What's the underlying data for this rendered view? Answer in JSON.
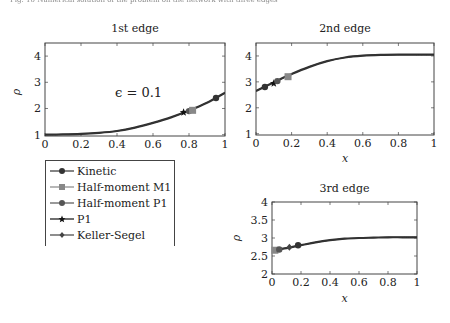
{
  "caption": "Fig. 10 Numerical solution of the problem on the network with three edges",
  "chart_data": [
    {
      "type": "line",
      "title": "1st edge",
      "xlabel": "",
      "ylabel": "ρ",
      "xlim": [
        0,
        1
      ],
      "ylim": [
        0.95,
        4.5
      ],
      "xticks": [
        "0",
        "0.2",
        "0.4",
        "0.6",
        "0.8",
        "1"
      ],
      "yticks": [
        "1",
        "2",
        "3",
        "4"
      ],
      "annotation": "ϵ = 0.1",
      "grid": false,
      "x": [
        0,
        0.1,
        0.2,
        0.3,
        0.4,
        0.5,
        0.6,
        0.7,
        0.8,
        0.9,
        1.0
      ],
      "series": [
        {
          "name": "Kinetic",
          "values": [
            1.0,
            1.01,
            1.03,
            1.07,
            1.14,
            1.27,
            1.45,
            1.66,
            1.92,
            2.22,
            2.6
          ]
        },
        {
          "name": "Half-moment M1",
          "values": [
            1.0,
            1.01,
            1.03,
            1.07,
            1.14,
            1.27,
            1.45,
            1.66,
            1.92,
            2.22,
            2.6
          ]
        },
        {
          "name": "Half-moment P1",
          "values": [
            1.0,
            1.01,
            1.03,
            1.07,
            1.14,
            1.27,
            1.45,
            1.66,
            1.92,
            2.22,
            2.6
          ]
        },
        {
          "name": "P1",
          "values": [
            1.0,
            1.01,
            1.03,
            1.07,
            1.14,
            1.27,
            1.45,
            1.66,
            1.92,
            2.22,
            2.6
          ]
        },
        {
          "name": "Keller-Segel",
          "values": [
            1.0,
            1.01,
            1.03,
            1.07,
            1.14,
            1.27,
            1.45,
            1.66,
            1.92,
            2.22,
            2.6
          ]
        }
      ],
      "markers": [
        {
          "series": "P1",
          "x": 0.77,
          "y": 1.86
        },
        {
          "series": "Half-moment P1",
          "x": 0.8,
          "y": 1.9
        },
        {
          "series": "Half-moment M1",
          "x": 0.82,
          "y": 1.93
        },
        {
          "series": "Kinetic",
          "x": 0.95,
          "y": 2.4
        }
      ]
    },
    {
      "type": "line",
      "title": "2nd edge",
      "xlabel": "x",
      "ylabel": "",
      "xlim": [
        0,
        1
      ],
      "ylim": [
        0.95,
        4.5
      ],
      "xticks": [
        "0",
        "0.2",
        "0.4",
        "0.6",
        "0.8",
        "1"
      ],
      "yticks": [
        "1",
        "2",
        "3",
        "4"
      ],
      "grid": false,
      "x": [
        0,
        0.1,
        0.2,
        0.3,
        0.4,
        0.5,
        0.6,
        0.7,
        0.8,
        0.9,
        1.0
      ],
      "series": [
        {
          "name": "Kinetic",
          "values": [
            2.65,
            2.98,
            3.3,
            3.58,
            3.8,
            3.94,
            4.01,
            4.04,
            4.05,
            4.05,
            4.05
          ]
        },
        {
          "name": "Half-moment M1",
          "values": [
            2.65,
            2.98,
            3.3,
            3.58,
            3.8,
            3.94,
            4.01,
            4.04,
            4.05,
            4.05,
            4.05
          ]
        },
        {
          "name": "Half-moment P1",
          "values": [
            2.65,
            2.98,
            3.3,
            3.58,
            3.8,
            3.94,
            4.01,
            4.04,
            4.05,
            4.05,
            4.05
          ]
        },
        {
          "name": "P1",
          "values": [
            2.65,
            2.98,
            3.3,
            3.58,
            3.8,
            3.94,
            4.01,
            4.04,
            4.05,
            4.05,
            4.05
          ]
        },
        {
          "name": "Keller-Segel",
          "values": [
            2.65,
            2.98,
            3.3,
            3.58,
            3.8,
            3.94,
            4.01,
            4.04,
            4.05,
            4.05,
            4.05
          ]
        }
      ],
      "markers": [
        {
          "series": "Kinetic",
          "x": 0.05,
          "y": 2.8
        },
        {
          "series": "P1",
          "x": 0.1,
          "y": 2.95
        },
        {
          "series": "Half-moment P1",
          "x": 0.12,
          "y": 3.03
        },
        {
          "series": "Half-moment M1",
          "x": 0.18,
          "y": 3.2
        }
      ]
    },
    {
      "type": "line",
      "title": "3rd edge",
      "xlabel": "x",
      "ylabel": "ρ",
      "xlim": [
        0,
        1
      ],
      "ylim": [
        2,
        4
      ],
      "xticks": [
        "0",
        "0.2",
        "0.4",
        "0.6",
        "0.8",
        "1"
      ],
      "yticks": [
        "2",
        "2.5",
        "3",
        "3.5",
        "4"
      ],
      "grid": false,
      "x": [
        0,
        0.1,
        0.2,
        0.3,
        0.4,
        0.5,
        0.6,
        0.7,
        0.8,
        0.9,
        1.0
      ],
      "series": [
        {
          "name": "Kinetic",
          "values": [
            2.66,
            2.72,
            2.8,
            2.88,
            2.94,
            2.98,
            3.0,
            3.01,
            3.02,
            3.02,
            3.02
          ]
        },
        {
          "name": "Half-moment M1",
          "values": [
            2.66,
            2.72,
            2.8,
            2.88,
            2.94,
            2.98,
            3.0,
            3.01,
            3.02,
            3.02,
            3.02
          ]
        },
        {
          "name": "Half-moment P1",
          "values": [
            2.66,
            2.72,
            2.8,
            2.88,
            2.94,
            2.98,
            3.0,
            3.01,
            3.02,
            3.02,
            3.02
          ]
        },
        {
          "name": "P1",
          "values": [
            2.66,
            2.72,
            2.8,
            2.88,
            2.94,
            2.98,
            3.0,
            3.01,
            3.02,
            3.02,
            3.02
          ]
        },
        {
          "name": "Keller-Segel",
          "values": [
            2.66,
            2.72,
            2.8,
            2.88,
            2.94,
            2.98,
            3.0,
            3.01,
            3.02,
            3.02,
            3.02
          ]
        }
      ],
      "markers": [
        {
          "series": "Half-moment M1",
          "x": 0.02,
          "y": 2.66
        },
        {
          "series": "Half-moment P1",
          "x": 0.05,
          "y": 2.68
        },
        {
          "series": "Keller-Segel",
          "x": 0.12,
          "y": 2.74
        },
        {
          "series": "Kinetic",
          "x": 0.18,
          "y": 2.8
        }
      ]
    }
  ],
  "legend": {
    "items": [
      {
        "label": "Kinetic",
        "marker": "circle",
        "color": "#333333"
      },
      {
        "label": "Half-moment M1",
        "marker": "square",
        "color": "#888888"
      },
      {
        "label": "Half-moment P1",
        "marker": "circle",
        "color": "#555555"
      },
      {
        "label": "P1",
        "marker": "star",
        "color": "#111111"
      },
      {
        "label": "Keller-Segel",
        "marker": "diamond",
        "color": "#444444"
      }
    ]
  },
  "colors": {
    "curve": "#333333",
    "frame": "#444444"
  }
}
